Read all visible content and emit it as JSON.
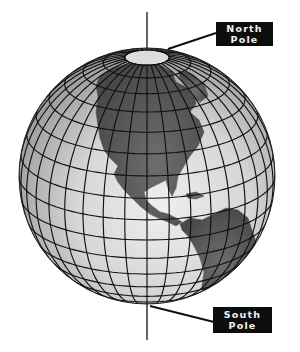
{
  "diagram": {
    "labels": {
      "north": {
        "line1": "North",
        "line2": "Pole"
      },
      "south": {
        "line1": "South",
        "line2": "Pole"
      }
    },
    "colors": {
      "background": "#ffffff",
      "ocean_light": "#ececec",
      "ocean_dark": "#9a9a9a",
      "land": "#5e5e5e",
      "grid": "#111111",
      "label_bg": "#0d0d0d",
      "label_text": "#f2f2f2"
    },
    "globe": {
      "center_x": 147,
      "center_y": 176,
      "radius": 128,
      "tilt_deg": 20,
      "grid_step_deg": 10,
      "pole_cap_lat_deg": 80
    },
    "axis": {
      "north": {
        "x": 147,
        "y_top": 12
      },
      "south": {
        "x": 147,
        "y_bottom": 340
      }
    },
    "leaders": {
      "north": {
        "x1": 168,
        "y1": 49,
        "x2": 216,
        "y2": 33
      },
      "south": {
        "x1": 150,
        "y1": 306,
        "x2": 214,
        "y2": 322
      }
    },
    "continents": [
      {
        "name": "North America",
        "points": "100,76 112,68 128,64 146,62 162,66 172,72 176,82 184,86 194,92 196,104 190,112 199,120 204,132 198,146 190,156 184,166 178,176 176,188 172,196 168,188 166,180 158,184 150,188 144,192 146,200 152,206 160,212 168,214 176,218 182,222 176,226 168,222 158,218 150,214 140,206 132,198 124,190 118,182 114,174 118,166 110,158 104,150 100,138 98,126 96,112 98,96 96,86"
      },
      {
        "name": "Greenland hint",
        "points": "178,70 192,74 204,84 208,96 200,102 192,96 186,86 180,78"
      },
      {
        "name": "Caribbean",
        "points": "186,194 196,192 204,196 196,199 188,198"
      },
      {
        "name": "South America",
        "points": "180,224 190,218 202,220 214,214 226,208 238,210 248,218 252,230 256,242 250,254 240,266 230,276 222,286 212,294 204,298 202,286 204,272 200,258 194,246 188,236 182,230"
      }
    ]
  }
}
